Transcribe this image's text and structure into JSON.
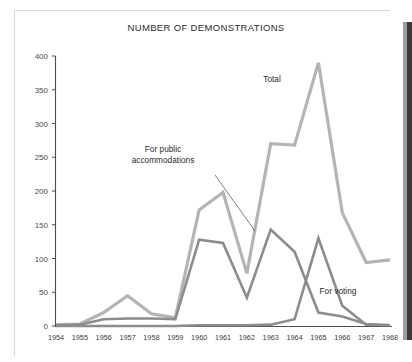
{
  "chart_data": {
    "type": "line",
    "title": "NUMBER OF DEMONSTRATIONS",
    "xlabel": "",
    "ylabel": "",
    "grid": false,
    "legend_position": "inline-annotations",
    "x": [
      1954,
      1955,
      1956,
      1957,
      1958,
      1959,
      1960,
      1961,
      1962,
      1963,
      1964,
      1965,
      1966,
      1967,
      1968
    ],
    "categories": [
      "1954",
      "1955",
      "1956",
      "1957",
      "1958",
      "1959",
      "1960",
      "1961",
      "1962",
      "1963",
      "1964",
      "1965",
      "1966",
      "1967",
      "1968"
    ],
    "ylim": [
      0,
      400
    ],
    "xlim": [
      1954,
      1968
    ],
    "yticks": [
      0,
      50,
      100,
      150,
      200,
      250,
      300,
      350,
      400
    ],
    "ytick_labels": [
      "0",
      "50",
      "100",
      "150",
      "200",
      "250",
      "300",
      "350",
      "400"
    ],
    "series": [
      {
        "name": "Total",
        "color": "#b4b4b4",
        "width": 3.2,
        "values": [
          2,
          3,
          20,
          45,
          18,
          12,
          172,
          198,
          78,
          270,
          268,
          390,
          168,
          94,
          98
        ]
      },
      {
        "name": "For public accommodations",
        "color": "#8c8c8c",
        "width": 2.6,
        "values": [
          1,
          2,
          10,
          11,
          11,
          10,
          128,
          123,
          42,
          143,
          110,
          20,
          14,
          3,
          1
        ]
      },
      {
        "name": "For voting",
        "color": "#8c8c8c",
        "width": 2.6,
        "values": [
          0,
          0,
          0,
          0,
          0,
          0,
          1,
          1,
          1,
          2,
          10,
          130,
          30,
          2,
          1
        ]
      }
    ],
    "annotations": [
      {
        "name": "total-label",
        "text": "Total",
        "x_px": 272,
        "y_px": 82
      },
      {
        "name": "public-accommodations-label",
        "text_lines": [
          "For public",
          "accommodations"
        ],
        "x_px": 163,
        "y_px": 152
      },
      {
        "name": "for-voting-label",
        "text": "For voting",
        "x_px": 338,
        "y_px": 294
      }
    ],
    "leader_lines": [
      {
        "name": "public-accommodations-leader",
        "x1_px": 215,
        "y1_px": 175,
        "x2_px": 255,
        "y2_px": 231
      }
    ]
  }
}
